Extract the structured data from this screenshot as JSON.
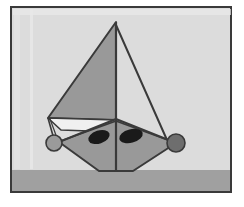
{
  "artwork": {
    "title": "Sailboat geometric illustration",
    "caption": "",
    "canvas": {
      "width": 244,
      "height": 207
    },
    "colors": {
      "page_background": "#ffffff",
      "sky_background": "#dcdcdc",
      "ground": "#a0a0a0",
      "frame_border": "#3a3a3a",
      "frame_inner_highlight": "#f2f2f2",
      "sail_fill": "#999999",
      "sail_right_fill": "#dcdcdc",
      "hull_fill": "#999999",
      "hull_upper_fill": "#f0f0f0",
      "eye_fill": "#1a1a1a",
      "circle_left_fill": "#9a9a9a",
      "circle_right_fill": "#6e6e6e",
      "outline": "#3a3a3a"
    },
    "frame": {
      "x": 10,
      "y": 6,
      "width": 222,
      "height": 187,
      "stroke_width": 2
    },
    "ground": {
      "x": 12,
      "y": 170,
      "width": 218,
      "height": 21,
      "label": "ground-strip"
    },
    "shapes": [
      {
        "name": "main-sail",
        "type": "polygon",
        "points": "116,22 116,120 48,118",
        "fill": "#999999"
      },
      {
        "name": "jib-sail",
        "type": "polygon",
        "points": "116,25 116,122 166,140",
        "fill": "#dcdcdc"
      },
      {
        "name": "mast",
        "type": "line",
        "x1": 116,
        "y1": 22,
        "x2": 116,
        "y2": 172
      },
      {
        "name": "hull-upper-left",
        "type": "polygon",
        "points": "48,118 116,120 116,133 62,128",
        "fill": "#f0f0f0"
      },
      {
        "name": "hull-body",
        "type": "polygon",
        "points": "60,142 116,120 175,143 132,171 98,171",
        "fill": "#999999"
      },
      {
        "name": "eye-left",
        "type": "ellipse",
        "cx": 99,
        "cy": 137,
        "rx": 11,
        "ry": 7,
        "rotation": -18,
        "fill": "#1a1a1a"
      },
      {
        "name": "eye-right",
        "type": "ellipse",
        "cx": 131,
        "cy": 136,
        "rx": 12,
        "ry": 7,
        "rotation": -14,
        "fill": "#1a1a1a"
      },
      {
        "name": "circle-left-bow-fitting",
        "type": "circle",
        "cx": 54,
        "cy": 143,
        "r": 8,
        "fill": "#9a9a9a"
      },
      {
        "name": "circle-right-stern-fitting",
        "type": "circle",
        "cx": 176,
        "cy": 143,
        "r": 9,
        "fill": "#6e6e6e"
      },
      {
        "name": "rigging-line-left-upper",
        "type": "line",
        "x1": 48,
        "y1": 118,
        "x2": 54,
        "y2": 143
      },
      {
        "name": "rigging-line-left-lower",
        "type": "line",
        "x1": 54,
        "y1": 143,
        "x2": 116,
        "y2": 121
      },
      {
        "name": "rigging-line-right",
        "type": "line",
        "x1": 116,
        "y1": 25,
        "x2": 176,
        "y2": 143
      }
    ]
  }
}
